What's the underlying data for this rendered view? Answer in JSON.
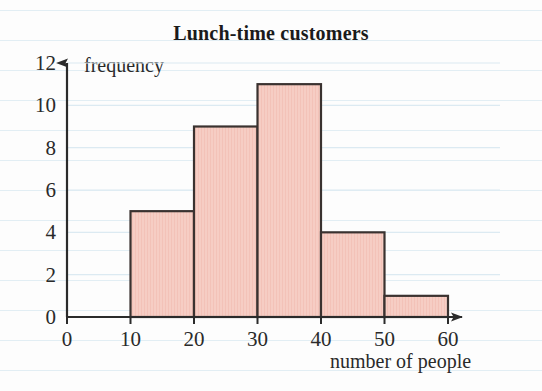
{
  "chart_data": {
    "type": "bar",
    "title": "Lunch-time customers",
    "xlabel": "number of people",
    "ylabel": "frequency",
    "grid": true,
    "legend": "none",
    "xlim": [
      0,
      60
    ],
    "ylim": [
      0,
      12
    ],
    "xticks": [
      "0",
      "10",
      "20",
      "30",
      "40",
      "50",
      "60"
    ],
    "yticks": [
      "0",
      "2",
      "4",
      "6",
      "8",
      "10",
      "12"
    ],
    "bin_width": 10,
    "categories": [
      "10-20",
      "20-30",
      "30-40",
      "40-50",
      "50-60"
    ],
    "bin_starts": [
      10,
      20,
      30,
      40,
      50
    ],
    "bin_ends": [
      20,
      30,
      40,
      50,
      60
    ],
    "values": [
      5,
      9,
      11,
      4,
      1
    ],
    "bar_fill_color": "#f6cdc4",
    "bar_edge_color": "#3a3230",
    "axis_color": "#2b2b2b",
    "grid_color": "#dceaf2"
  },
  "axes": {
    "y_arrow": "up-arrow-icon",
    "x_arrow": "right-arrow-icon"
  }
}
